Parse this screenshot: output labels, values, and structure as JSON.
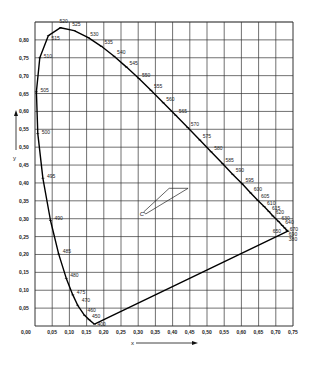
{
  "chart_data": {
    "type": "line",
    "title": "",
    "xlabel": "x",
    "ylabel": "y",
    "xlim": [
      0,
      0.75
    ],
    "ylim": [
      0,
      0.85
    ],
    "grid": true,
    "x_ticks": [
      "0,00",
      "0,05",
      "0,10",
      "0,15",
      "0,20",
      "0,25",
      "0,30",
      "0,35",
      "0,40",
      "0,45",
      "0,50",
      "0,55",
      "0,60",
      "0,65",
      "0,70",
      "0,75"
    ],
    "y_ticks": [
      "0,05",
      "0,10",
      "0,15",
      "0,20",
      "0,25",
      "0,30",
      "0,35",
      "0,40",
      "0,45",
      "0,50",
      "0,55",
      "0,60",
      "0,65",
      "0,70",
      "0,75",
      "0,80"
    ],
    "series": [
      {
        "name": "spectral locus",
        "points": [
          {
            "label": "380",
            "x": 0.735,
            "y": 0.265
          },
          {
            "label": "400",
            "x": 0.173,
            "y": 0.005
          },
          {
            "label": "450",
            "x": 0.157,
            "y": 0.018
          },
          {
            "label": "460",
            "x": 0.144,
            "y": 0.03
          },
          {
            "label": "470",
            "x": 0.124,
            "y": 0.058
          },
          {
            "label": "475",
            "x": 0.11,
            "y": 0.087
          },
          {
            "label": "480",
            "x": 0.091,
            "y": 0.133
          },
          {
            "label": "485",
            "x": 0.069,
            "y": 0.201
          },
          {
            "label": "490",
            "x": 0.045,
            "y": 0.295
          },
          {
            "label": "495",
            "x": 0.023,
            "y": 0.413
          },
          {
            "label": "500",
            "x": 0.008,
            "y": 0.538
          },
          {
            "label": "505",
            "x": 0.004,
            "y": 0.655
          },
          {
            "label": "510",
            "x": 0.014,
            "y": 0.75
          },
          {
            "label": "515",
            "x": 0.039,
            "y": 0.812
          },
          {
            "label": "520",
            "x": 0.074,
            "y": 0.834
          },
          {
            "label": "525",
            "x": 0.114,
            "y": 0.826
          },
          {
            "label": "530",
            "x": 0.155,
            "y": 0.806
          },
          {
            "label": "535",
            "x": 0.193,
            "y": 0.782
          },
          {
            "label": "540",
            "x": 0.23,
            "y": 0.754
          },
          {
            "label": "545",
            "x": 0.266,
            "y": 0.724
          },
          {
            "label": "550",
            "x": 0.302,
            "y": 0.692
          },
          {
            "label": "555",
            "x": 0.337,
            "y": 0.659
          },
          {
            "label": "560",
            "x": 0.373,
            "y": 0.624
          },
          {
            "label": "565",
            "x": 0.409,
            "y": 0.589
          },
          {
            "label": "570",
            "x": 0.444,
            "y": 0.555
          },
          {
            "label": "575",
            "x": 0.479,
            "y": 0.52
          },
          {
            "label": "580",
            "x": 0.512,
            "y": 0.487
          },
          {
            "label": "585",
            "x": 0.545,
            "y": 0.454
          },
          {
            "label": "590",
            "x": 0.575,
            "y": 0.424
          },
          {
            "label": "595",
            "x": 0.603,
            "y": 0.397
          },
          {
            "label": "600",
            "x": 0.627,
            "y": 0.372
          },
          {
            "label": "605",
            "x": 0.648,
            "y": 0.351
          },
          {
            "label": "610",
            "x": 0.666,
            "y": 0.334
          },
          {
            "label": "615",
            "x": 0.68,
            "y": 0.32
          },
          {
            "label": "620",
            "x": 0.691,
            "y": 0.308
          },
          {
            "label": "630",
            "x": 0.708,
            "y": 0.292
          },
          {
            "label": "640",
            "x": 0.719,
            "y": 0.281
          },
          {
            "label": "650",
            "x": 0.726,
            "y": 0.274
          },
          {
            "label": "670",
            "x": 0.732,
            "y": 0.268
          },
          {
            "label": "690",
            "x": 0.735,
            "y": 0.265
          }
        ]
      }
    ],
    "annotations": [
      {
        "text": "C",
        "x": 0.31,
        "y": 0.316,
        "note": "white point C with a thin quadrilateral marker"
      }
    ]
  },
  "labels": {
    "x_axis": "x",
    "y_axis": "y",
    "point_c": "C"
  }
}
